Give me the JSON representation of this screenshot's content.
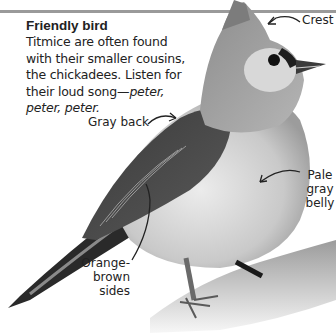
{
  "caption": {
    "title": "Friendly bird",
    "body_plain": "Titmice are often found with their smaller cousins, the chickadees. Listen for their loud song—",
    "body_italic": "peter, peter, peter."
  },
  "labels": {
    "crest": "Crest",
    "back": "Gray back",
    "belly": "Pale gray belly",
    "sides": "Orange-brown sides"
  },
  "image": {
    "subject": "tufted-titmouse-icon",
    "style": "grayscale photo"
  }
}
